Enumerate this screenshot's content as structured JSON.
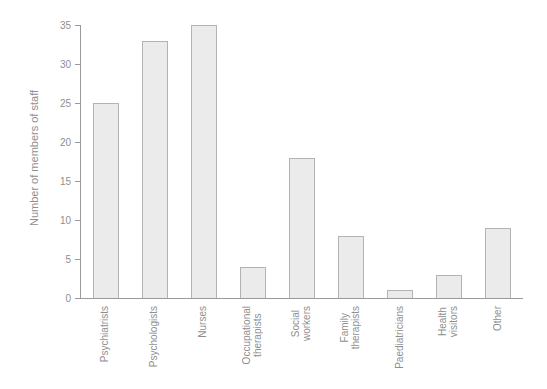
{
  "chart_data": {
    "type": "bar",
    "categories": [
      "Psychiatrists",
      "Psychologists",
      "Nurses",
      "Occupational\ntherapists",
      "Social\nworkers",
      "Family\ntherapists",
      "Paediatricians",
      "Health\nvisitors",
      "Other"
    ],
    "values": [
      25,
      33,
      35,
      4,
      18,
      8,
      1,
      3,
      9
    ],
    "title": "",
    "xlabel": "",
    "ylabel": "Number of members of staff",
    "ylim": [
      0,
      35
    ],
    "yticks": [
      0,
      5,
      10,
      15,
      20,
      25,
      30,
      35
    ],
    "grid": false,
    "legend": null,
    "bar_orientation": "vertical"
  },
  "colors": {
    "background": "#ffffff",
    "bar_fill": "#ebebeb",
    "bar_border": "#b3b3b3",
    "axis": "#9a9a9a",
    "text": "#8f8f8f"
  }
}
